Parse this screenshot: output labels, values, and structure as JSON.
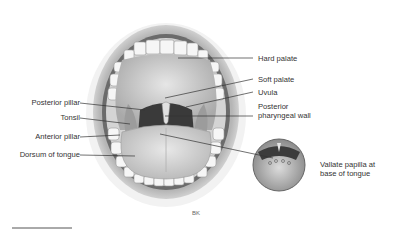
{
  "figure": {
    "artist_initials": "BK",
    "labels_left": [
      {
        "text": "Posterior pillar"
      },
      {
        "text": "Tonsil"
      },
      {
        "text": "Anterior pillar"
      },
      {
        "text": "Dorsum of tongue"
      }
    ],
    "labels_right": [
      {
        "text": "Hard palate"
      },
      {
        "text": "Soft palate"
      },
      {
        "text": "Uvula"
      },
      {
        "line1": "Posterior",
        "line2": "pharyngeal wall"
      }
    ],
    "inset": {
      "line1": "Vallate papilla at",
      "line2": "base of tongue"
    },
    "colors": {
      "lip": "#c8c8c8",
      "tongue": "#d9d9d9",
      "throat": "#3a3a3a",
      "teeth": "#f4f4f4",
      "leader_line": "#333333"
    }
  }
}
